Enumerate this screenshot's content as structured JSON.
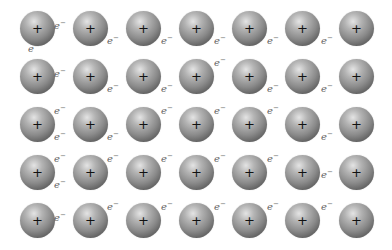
{
  "diagram": {
    "title": "",
    "ion_label": "+",
    "electron_label": "e",
    "electron_charge": "−",
    "colors": {
      "ion_light": "#e4e4e4",
      "ion_mid": "#8a8a8a",
      "ion_dark": "#3e3e3e",
      "electron_text": "#666666",
      "background": "#ffffff"
    },
    "grid": {
      "columns_x": [
        37,
        90,
        143,
        196,
        249,
        302,
        356
      ],
      "rows_y": [
        28,
        76,
        124,
        172,
        220
      ],
      "ion_radius": 17
    },
    "electrons": [
      {
        "x": 59,
        "y": 23
      },
      {
        "x": 33,
        "y": 46
      },
      {
        "x": 112,
        "y": 38
      },
      {
        "x": 166,
        "y": 38
      },
      {
        "x": 219,
        "y": 38
      },
      {
        "x": 272,
        "y": 38
      },
      {
        "x": 326,
        "y": 38
      },
      {
        "x": 59,
        "y": 71
      },
      {
        "x": 112,
        "y": 86
      },
      {
        "x": 166,
        "y": 86
      },
      {
        "x": 219,
        "y": 60
      },
      {
        "x": 272,
        "y": 86
      },
      {
        "x": 326,
        "y": 86
      },
      {
        "x": 59,
        "y": 108
      },
      {
        "x": 59,
        "y": 134
      },
      {
        "x": 112,
        "y": 134
      },
      {
        "x": 166,
        "y": 108
      },
      {
        "x": 219,
        "y": 108
      },
      {
        "x": 272,
        "y": 108
      },
      {
        "x": 326,
        "y": 134
      },
      {
        "x": 59,
        "y": 156
      },
      {
        "x": 59,
        "y": 182
      },
      {
        "x": 112,
        "y": 156
      },
      {
        "x": 166,
        "y": 156
      },
      {
        "x": 219,
        "y": 156
      },
      {
        "x": 272,
        "y": 156
      },
      {
        "x": 326,
        "y": 172
      },
      {
        "x": 59,
        "y": 215
      },
      {
        "x": 112,
        "y": 204
      },
      {
        "x": 166,
        "y": 204
      },
      {
        "x": 219,
        "y": 204
      },
      {
        "x": 272,
        "y": 204
      },
      {
        "x": 326,
        "y": 204
      }
    ]
  }
}
